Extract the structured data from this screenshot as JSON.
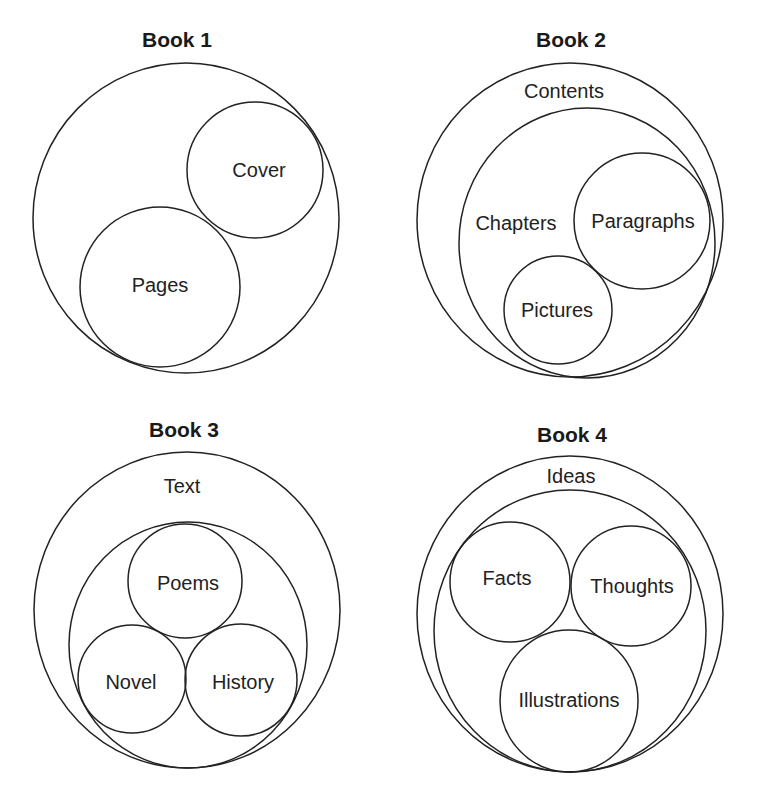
{
  "diagrams": [
    {
      "title": "Book 1",
      "outer_label": "",
      "inner_label": "",
      "items": [
        "Cover",
        "Pages"
      ]
    },
    {
      "title": "Book 2",
      "outer_label": "Contents",
      "inner_label": "Chapters",
      "items": [
        "Paragraphs",
        "Pictures"
      ]
    },
    {
      "title": "Book 3",
      "outer_label": "Text",
      "inner_label": "",
      "items": [
        "Poems",
        "Novel",
        "History"
      ]
    },
    {
      "title": "Book 4",
      "outer_label": "Ideas",
      "inner_label": "",
      "items": [
        "Facts",
        "Thoughts",
        "Illustrations"
      ]
    }
  ]
}
